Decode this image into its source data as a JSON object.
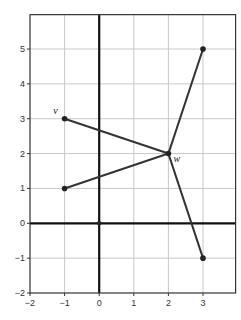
{
  "chart_data": {
    "type": "scatter",
    "title": "",
    "xlabel": "",
    "ylabel": "",
    "xlim": [
      -2,
      4
    ],
    "ylim": [
      -2,
      6
    ],
    "grid": true,
    "x_ticks": [
      -2,
      -1,
      0,
      1,
      2,
      3
    ],
    "y_ticks": [
      -2,
      -1,
      0,
      1,
      2,
      3,
      4,
      5
    ],
    "x_tick_labels": [
      "−2",
      "−1",
      "0",
      "1",
      "2",
      "3"
    ],
    "y_tick_labels": [
      "−2",
      "−1",
      "0",
      "1",
      "2",
      "3",
      "4",
      "5"
    ],
    "points": [
      {
        "name": "v",
        "x": -1,
        "y": 3,
        "label": "v"
      },
      {
        "name": "p1",
        "x": -1,
        "y": 1,
        "label": ""
      },
      {
        "name": "w",
        "x": 2,
        "y": 2,
        "label": "w"
      },
      {
        "name": "p2",
        "x": 3,
        "y": 5,
        "label": ""
      },
      {
        "name": "p3",
        "x": 3,
        "y": -1,
        "label": ""
      },
      {
        "name": "origin",
        "x": 0,
        "y": 0,
        "label": ""
      }
    ],
    "segments": [
      {
        "from": [
          -1,
          3
        ],
        "to": [
          2,
          2
        ]
      },
      {
        "from": [
          -1,
          1
        ],
        "to": [
          2,
          2
        ]
      },
      {
        "from": [
          2,
          2
        ],
        "to": [
          3,
          5
        ]
      },
      {
        "from": [
          2,
          2
        ],
        "to": [
          3,
          -1
        ]
      }
    ]
  },
  "colors": {
    "grid": "#c8c8c8",
    "axis": "#111111",
    "frame": "#333333",
    "segment": "#333333",
    "point": "#222222"
  }
}
